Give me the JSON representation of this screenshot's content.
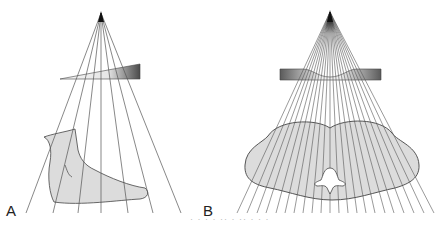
{
  "figure": {
    "panels": [
      {
        "label": "A",
        "title": "Wedge filter over foot",
        "source": {
          "x": 101,
          "y": 13
        },
        "ray_ends_x": [
          26,
          53,
          78,
          101,
          128,
          153,
          181
        ],
        "ray_end_y": 213,
        "filter": {
          "type": "wedge",
          "thin_x": 60,
          "thick_x": 140,
          "top_y": 64,
          "bottom_y": 79
        },
        "object": "foot"
      },
      {
        "label": "B",
        "title": "Bow-tie filter over body cross-section",
        "source": {
          "x": 330,
          "y": 12
        },
        "ray_ends_x": [
          237,
          247,
          257,
          266,
          276,
          285,
          294,
          303,
          312,
          321,
          330,
          339,
          348,
          357,
          366,
          375,
          385,
          394,
          404,
          414,
          424,
          434
        ],
        "ray_end_y": 213,
        "filter": {
          "type": "bow-tie",
          "left_x": 280,
          "right_x": 381,
          "top_y": 69,
          "bottom_y": 80
        },
        "object": "body-cross-section"
      }
    ],
    "caption": "· · ·  ·  ··  ·  ··  ·  · ·"
  },
  "colors": {
    "ray": "#555555",
    "object_fill": "#dcdcdc",
    "object_stroke": "#444444",
    "filter_dark": "#555555",
    "filter_light": "#f0f0f0"
  }
}
